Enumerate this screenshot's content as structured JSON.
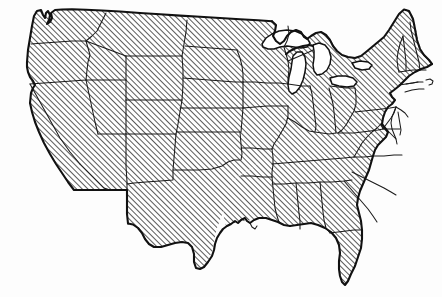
{
  "figure": {
    "kind": "line-art map",
    "description": "Outline map of the 48 contiguous United States with state boundaries, filled with diagonal hatching; Great Lakes left unfilled.",
    "background_color": "#ffffff",
    "line_color": "#111111",
    "hatch_color": "#1c1c1c",
    "fill_style": "diagonal-hatch-45deg",
    "width_px": 442,
    "height_px": 297,
    "has_labels": false,
    "has_legend": false,
    "has_title_text": false
  },
  "regions": {
    "landmass_name": "Contiguous United States",
    "water_bodies": [
      "Lake Superior",
      "Lake Michigan",
      "Lake Huron",
      "Lake Erie",
      "Lake Ontario"
    ],
    "states_depicted": [
      "Washington",
      "Oregon",
      "California",
      "Nevada",
      "Idaho",
      "Montana",
      "Wyoming",
      "Utah",
      "Arizona",
      "Colorado",
      "New Mexico",
      "North Dakota",
      "South Dakota",
      "Nebraska",
      "Kansas",
      "Oklahoma",
      "Texas",
      "Minnesota",
      "Iowa",
      "Missouri",
      "Arkansas",
      "Louisiana",
      "Wisconsin",
      "Illinois",
      "Michigan",
      "Indiana",
      "Ohio",
      "Kentucky",
      "Tennessee",
      "Mississippi",
      "Alabama",
      "Georgia",
      "Florida",
      "South Carolina",
      "North Carolina",
      "Virginia",
      "West Virginia",
      "Maryland",
      "Delaware",
      "Pennsylvania",
      "New Jersey",
      "New York",
      "Connecticut",
      "Rhode Island",
      "Massachusetts",
      "Vermont",
      "New Hampshire",
      "Maine"
    ],
    "state_count": 48
  }
}
